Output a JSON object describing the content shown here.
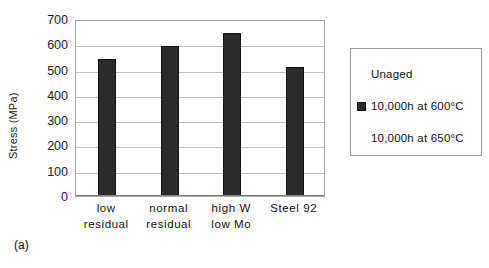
{
  "caption": "(a)",
  "legend": {
    "entries": [
      {
        "label": "Unaged",
        "swatch_color": "#ffffff",
        "swatch_visible": false
      },
      {
        "label": "10,000h at 600°C",
        "swatch_color": "#2b2b2b",
        "swatch_visible": true
      },
      {
        "label": "10,000h at 650°C",
        "swatch_color": "#ffffff",
        "swatch_visible": false
      }
    ]
  },
  "chart_data": {
    "type": "bar",
    "title": "",
    "xlabel": "",
    "ylabel": "Stress (MPa)",
    "ylim": [
      0,
      700
    ],
    "ytick_step": 100,
    "ytick_labels": [
      "700",
      "600",
      "500",
      "400",
      "300",
      "200",
      "100",
      "0"
    ],
    "grid": true,
    "legend_position": "right-outside",
    "categories": [
      "low\nresidual",
      "normal\nresidual",
      "high W\nlow Mo",
      "Steel 92"
    ],
    "category_lines": [
      [
        "low",
        "residual"
      ],
      [
        "normal",
        "residual"
      ],
      [
        "high W",
        "low Mo"
      ],
      [
        "Steel 92",
        ""
      ]
    ],
    "series": [
      {
        "name": "Unaged",
        "color": "#2b2b2b",
        "values": [
          540,
          592,
          643,
          510
        ]
      }
    ]
  }
}
